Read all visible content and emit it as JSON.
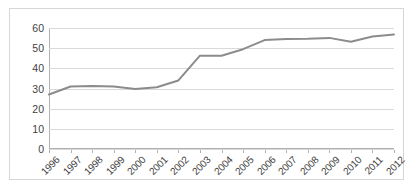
{
  "chart_data": {
    "type": "line",
    "title": "",
    "subtitle": "",
    "xlabel": "",
    "ylabel": "",
    "categories": [
      "1996",
      "1997",
      "1998",
      "1999",
      "2000",
      "2001",
      "2002",
      "2003",
      "2004",
      "2005",
      "2006",
      "2007",
      "2008",
      "2009",
      "2010",
      "2011",
      "2012"
    ],
    "values": [
      27,
      31,
      31.2,
      31,
      29.8,
      30.6,
      34,
      46.3,
      46.2,
      49.5,
      54,
      54.6,
      54.7,
      55.1,
      53.2,
      55.8,
      56.8
    ],
    "series": [
      {
        "name": "series-1",
        "values": [
          27,
          31,
          31.2,
          31,
          29.8,
          30.6,
          34,
          46.3,
          46.2,
          49.5,
          54,
          54.6,
          54.7,
          55.1,
          53.2,
          55.8,
          56.8
        ]
      }
    ],
    "yticks": [
      0,
      10,
      20,
      30,
      40,
      50,
      60
    ],
    "ytick_labels": [
      "0",
      "10",
      "20",
      "30",
      "40",
      "50",
      "60"
    ],
    "ylim": [
      0,
      60
    ],
    "grid": true,
    "legend": false,
    "legend_position": "none",
    "line_color": "#8c8c8c",
    "grid_color": "#d9d9d9",
    "axis_color": "#b0b0b0",
    "text_color": "#3f3f3f",
    "background": "#ffffff",
    "border_color": "#d7d7d7"
  }
}
